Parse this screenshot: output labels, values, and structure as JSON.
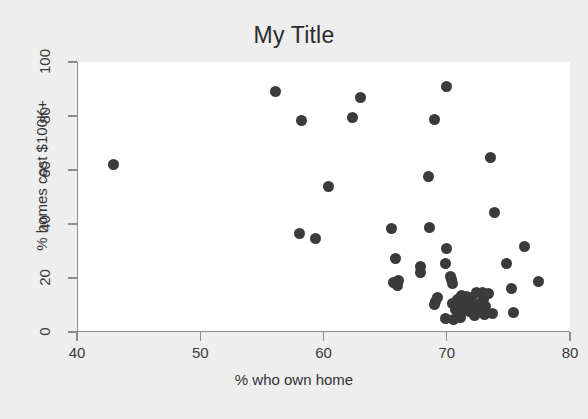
{
  "chart_data": {
    "type": "scatter",
    "title": "My Title",
    "xlabel": "% who own home",
    "ylabel": "% homes cost $100K+",
    "xlim": [
      40,
      80
    ],
    "ylim": [
      0,
      100
    ],
    "xticks": [
      40,
      50,
      60,
      70,
      80
    ],
    "yticks": [
      0,
      20,
      40,
      60,
      80,
      100
    ],
    "grid": false,
    "legend": false,
    "marker": {
      "shape": "circle",
      "color": "#3b3b3b",
      "size": 11
    },
    "series": [
      {
        "name": "states",
        "points": [
          [
            42.9,
            62.0
          ],
          [
            56.0,
            89.0
          ],
          [
            58.1,
            78.5
          ],
          [
            62.3,
            79.3
          ],
          [
            62.9,
            87.0
          ],
          [
            69.9,
            90.8
          ],
          [
            68.9,
            78.8
          ],
          [
            73.5,
            64.8
          ],
          [
            68.4,
            57.5
          ],
          [
            60.3,
            54.0
          ],
          [
            73.8,
            44.1
          ],
          [
            65.4,
            38.5
          ],
          [
            68.5,
            38.7
          ],
          [
            58.0,
            36.5
          ],
          [
            59.3,
            34.6
          ],
          [
            76.2,
            31.5
          ],
          [
            69.9,
            31.0
          ],
          [
            65.8,
            27.2
          ],
          [
            74.8,
            25.2
          ],
          [
            69.8,
            25.5
          ],
          [
            67.8,
            24.3
          ],
          [
            67.8,
            21.9
          ],
          [
            65.6,
            18.3
          ],
          [
            65.9,
            17.3
          ],
          [
            77.4,
            18.6
          ],
          [
            70.2,
            20.5
          ],
          [
            70.3,
            19.3
          ],
          [
            70.4,
            18.0
          ],
          [
            75.2,
            16.1
          ],
          [
            72.3,
            14.6
          ],
          [
            72.8,
            14.8
          ],
          [
            73.3,
            14.3
          ],
          [
            71.1,
            13.6
          ],
          [
            71.5,
            13.0
          ],
          [
            71.9,
            12.6
          ],
          [
            70.8,
            12.2
          ],
          [
            69.0,
            11.2
          ],
          [
            68.9,
            10.3
          ],
          [
            70.4,
            10.6
          ],
          [
            71.3,
            10.2
          ],
          [
            72.0,
            10.0
          ],
          [
            72.6,
            10.4
          ],
          [
            73.1,
            9.6
          ],
          [
            70.6,
            8.4
          ],
          [
            71.2,
            8.0
          ],
          [
            71.8,
            7.7
          ],
          [
            72.4,
            7.4
          ],
          [
            73.6,
            7.0
          ],
          [
            75.3,
            7.1
          ],
          [
            69.8,
            5.0
          ],
          [
            70.5,
            4.6
          ],
          [
            71.0,
            5.4
          ],
          [
            72.2,
            6.2
          ],
          [
            73.0,
            6.6
          ],
          [
            66.0,
            18.9
          ],
          [
            69.2,
            12.9
          ],
          [
            71.6,
            11.5
          ],
          [
            72.9,
            12.0
          ]
        ]
      }
    ]
  }
}
